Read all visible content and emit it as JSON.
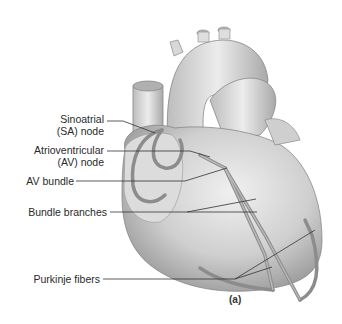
{
  "figure": {
    "caption": "(a)"
  },
  "labels": [
    {
      "id": "sa",
      "line1": "Sinoatrial",
      "line2": "(SA) node"
    },
    {
      "id": "av",
      "line1": "Atrioventricular",
      "line2": "(AV) node"
    },
    {
      "id": "avb",
      "line1": "AV bundle"
    },
    {
      "id": "bb",
      "line1": "Bundle branches"
    },
    {
      "id": "pf",
      "line1": "Purkinje fibers"
    }
  ],
  "colors": {
    "heart_fill": "#d4d4d4",
    "heart_shade": "#a8a8a8",
    "conduction": "#8a8a8a",
    "leader": "#333333"
  }
}
